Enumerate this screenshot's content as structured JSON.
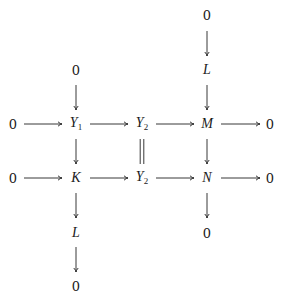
{
  "diagram": {
    "type": "commutative-diagram",
    "nodes": [
      {
        "id": "top0_M",
        "label": "0",
        "italic": false,
        "x": 207,
        "y": 15
      },
      {
        "id": "L_top",
        "label": "L",
        "italic": true,
        "x": 207,
        "y": 70
      },
      {
        "id": "top0_Y1",
        "label": "0",
        "italic": false,
        "x": 76,
        "y": 70
      },
      {
        "id": "row1_0l",
        "label": "0",
        "italic": false,
        "x": 13,
        "y": 124
      },
      {
        "id": "Y1",
        "label": "Y",
        "sub": "1",
        "italic": true,
        "x": 76,
        "y": 124
      },
      {
        "id": "Y2a",
        "label": "Y",
        "sub": "2",
        "italic": true,
        "x": 142,
        "y": 124
      },
      {
        "id": "M",
        "label": "M",
        "italic": true,
        "x": 207,
        "y": 124
      },
      {
        "id": "row1_0r",
        "label": "0",
        "italic": false,
        "x": 270,
        "y": 124
      },
      {
        "id": "row2_0l",
        "label": "0",
        "italic": false,
        "x": 13,
        "y": 178
      },
      {
        "id": "K",
        "label": "K",
        "italic": true,
        "x": 76,
        "y": 178
      },
      {
        "id": "Y2b",
        "label": "Y",
        "sub": "2",
        "italic": true,
        "x": 142,
        "y": 178
      },
      {
        "id": "N",
        "label": "N",
        "italic": true,
        "x": 207,
        "y": 178
      },
      {
        "id": "row2_0r",
        "label": "0",
        "italic": false,
        "x": 270,
        "y": 178
      },
      {
        "id": "bot0_N",
        "label": "0",
        "italic": false,
        "x": 207,
        "y": 233
      },
      {
        "id": "L_bot",
        "label": "L",
        "italic": true,
        "x": 76,
        "y": 233
      },
      {
        "id": "bot0_K",
        "label": "0",
        "italic": false,
        "x": 76,
        "y": 286
      }
    ],
    "arrows": [
      {
        "from": "row1_0l",
        "to": "Y1",
        "kind": "arrow",
        "x1": 24,
        "y1": 124,
        "x2": 62,
        "y2": 124
      },
      {
        "from": "Y1",
        "to": "Y2a",
        "kind": "arrow",
        "x1": 90,
        "y1": 124,
        "x2": 128,
        "y2": 124
      },
      {
        "from": "Y2a",
        "to": "M",
        "kind": "arrow",
        "x1": 156,
        "y1": 124,
        "x2": 194,
        "y2": 124
      },
      {
        "from": "M",
        "to": "row1_0r",
        "kind": "arrow",
        "x1": 221,
        "y1": 124,
        "x2": 260,
        "y2": 124
      },
      {
        "from": "row2_0l",
        "to": "K",
        "kind": "arrow",
        "x1": 24,
        "y1": 178,
        "x2": 62,
        "y2": 178
      },
      {
        "from": "K",
        "to": "Y2b",
        "kind": "arrow",
        "x1": 90,
        "y1": 178,
        "x2": 128,
        "y2": 178
      },
      {
        "from": "Y2b",
        "to": "N",
        "kind": "arrow",
        "x1": 156,
        "y1": 178,
        "x2": 194,
        "y2": 178
      },
      {
        "from": "N",
        "to": "row2_0r",
        "kind": "arrow",
        "x1": 221,
        "y1": 178,
        "x2": 260,
        "y2": 178
      },
      {
        "from": "top0_M",
        "to": "L_top",
        "kind": "arrow",
        "x1": 207,
        "y1": 31,
        "x2": 207,
        "y2": 56
      },
      {
        "from": "L_top",
        "to": "M",
        "kind": "arrow",
        "x1": 207,
        "y1": 85,
        "x2": 207,
        "y2": 110
      },
      {
        "from": "M",
        "to": "N",
        "kind": "arrow",
        "x1": 207,
        "y1": 139,
        "x2": 207,
        "y2": 164
      },
      {
        "from": "N",
        "to": "bot0_N",
        "kind": "arrow",
        "x1": 207,
        "y1": 193,
        "x2": 207,
        "y2": 218
      },
      {
        "from": "top0_Y1",
        "to": "Y1",
        "kind": "arrow",
        "x1": 76,
        "y1": 85,
        "x2": 76,
        "y2": 110
      },
      {
        "from": "Y1",
        "to": "K",
        "kind": "arrow",
        "x1": 76,
        "y1": 139,
        "x2": 76,
        "y2": 164
      },
      {
        "from": "K",
        "to": "L_bot",
        "kind": "arrow",
        "x1": 76,
        "y1": 193,
        "x2": 76,
        "y2": 218
      },
      {
        "from": "L_bot",
        "to": "bot0_K",
        "kind": "arrow",
        "x1": 76,
        "y1": 247,
        "x2": 76,
        "y2": 272
      },
      {
        "from": "Y2a",
        "to": "Y2b",
        "kind": "equals",
        "x1": 142,
        "y1": 139,
        "x2": 142,
        "y2": 164
      }
    ]
  }
}
